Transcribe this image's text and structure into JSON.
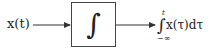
{
  "diagram": {
    "type": "block-diagram",
    "input": {
      "label": "x(t)",
      "var": "x",
      "arg": "t"
    },
    "block": {
      "symbol": "∫",
      "name": "integrator"
    },
    "output": {
      "integral_sign": "∫",
      "upper_limit": "t",
      "lower_limit": "−∞",
      "integrand": "x(τ)dτ"
    },
    "colors": {
      "line": "#333333",
      "box_border": "#444444",
      "background": "#ffffff"
    }
  }
}
